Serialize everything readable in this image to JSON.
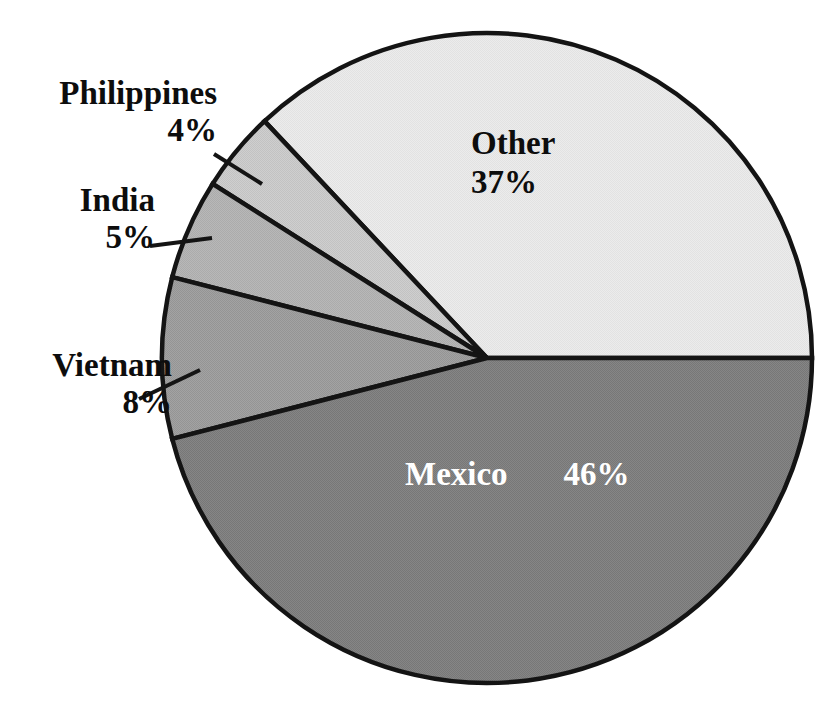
{
  "chart_data": {
    "type": "pie",
    "title": "",
    "categories": [
      "Other",
      "Philippines",
      "India",
      "Vietnam",
      "Mexico"
    ],
    "values": [
      37,
      4,
      5,
      8,
      46
    ],
    "unit": "%",
    "start_angle_deg": 0,
    "direction": "counterclockwise",
    "legend": "none",
    "grid": false,
    "slices": [
      {
        "label": "Other",
        "percent_text": "37%",
        "value": 37,
        "color": "#e9e9e9",
        "text_color": "#0d0d0d",
        "label_position": "inside"
      },
      {
        "label": "Philippines",
        "percent_text": "4%",
        "value": 4,
        "color": "#c9c9c9",
        "text_color": "#0d0d0d",
        "label_position": "outside-left"
      },
      {
        "label": "India",
        "percent_text": "5%",
        "value": 5,
        "color": "#b2b2b2",
        "text_color": "#0d0d0d",
        "label_position": "outside-left"
      },
      {
        "label": "Vietnam",
        "percent_text": "8%",
        "value": 8,
        "color": "#9c9c9c",
        "text_color": "#0d0d0d",
        "label_position": "outside-left"
      },
      {
        "label": "Mexico",
        "percent_text": "46%",
        "value": 46,
        "color": "#7f7f7f",
        "text_color": "#ffffff",
        "label_position": "inside"
      }
    ]
  },
  "labels": {
    "other": {
      "name": "Other",
      "pct": "37%"
    },
    "philippines": {
      "name": "Philippines",
      "pct": "4%"
    },
    "india": {
      "name": "India",
      "pct": "5%"
    },
    "vietnam": {
      "name": "Vietnam",
      "pct": "8%"
    },
    "mexico": {
      "name": "Mexico",
      "pct": "46%"
    }
  },
  "style": {
    "background": "#ffffff",
    "outline_color": "#141414",
    "color_other": "#e9e9e9",
    "color_philippines": "#c9c9c9",
    "color_india": "#b2b2b2",
    "color_vietnam": "#9c9c9c",
    "color_mexico": "#7f7f7f"
  },
  "geometry": {
    "center_x": 487,
    "center_y": 358,
    "radius": 325
  }
}
